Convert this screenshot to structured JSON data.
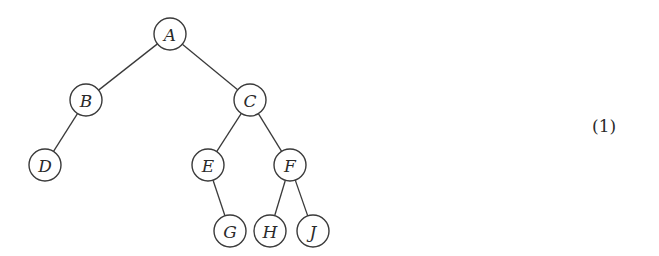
{
  "diagram": {
    "type": "binary-tree",
    "node_radius": 16,
    "nodes": [
      {
        "id": "A",
        "label": "A",
        "x": 170,
        "y": 34
      },
      {
        "id": "B",
        "label": "B",
        "x": 86,
        "y": 100
      },
      {
        "id": "C",
        "label": "C",
        "x": 250,
        "y": 100
      },
      {
        "id": "D",
        "label": "D",
        "x": 45,
        "y": 165
      },
      {
        "id": "E",
        "label": "E",
        "x": 208,
        "y": 165
      },
      {
        "id": "F",
        "label": "F",
        "x": 290,
        "y": 165
      },
      {
        "id": "G",
        "label": "G",
        "x": 230,
        "y": 231
      },
      {
        "id": "H",
        "label": "H",
        "x": 270,
        "y": 231
      },
      {
        "id": "J",
        "label": "J",
        "x": 313,
        "y": 231
      }
    ],
    "edges": [
      [
        "A",
        "B"
      ],
      [
        "A",
        "C"
      ],
      [
        "B",
        "D"
      ],
      [
        "C",
        "E"
      ],
      [
        "C",
        "F"
      ],
      [
        "E",
        "G"
      ],
      [
        "F",
        "H"
      ],
      [
        "F",
        "J"
      ]
    ]
  },
  "equation_number": "(1)"
}
